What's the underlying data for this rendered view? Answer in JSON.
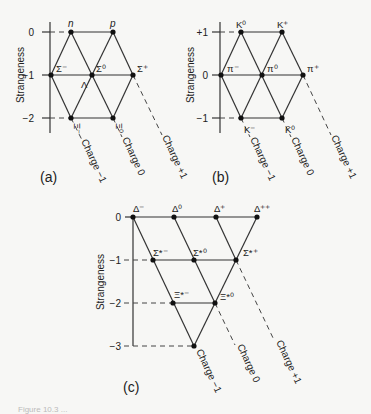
{
  "panels": {
    "a": {
      "label": "(a)",
      "axis_title": "Strangeness",
      "ticks": [
        "0",
        "−1",
        "−2"
      ],
      "particles": {
        "n": "n",
        "p": "p",
        "sigma_minus": "Σ⁻",
        "sigma_zero": "Σ⁰",
        "lambda": "Λ",
        "sigma_plus": "Σ⁺",
        "xi_minus": "Ξ⁻",
        "xi_zero": "Ξ⁰"
      },
      "charge_lines": [
        "Charge −1",
        "Charge 0",
        "Charge +1"
      ]
    },
    "b": {
      "label": "(b)",
      "axis_title": "Strangeness",
      "ticks": [
        "+1",
        "0",
        "−1"
      ],
      "particles": {
        "k_zero": "K⁰",
        "k_plus": "K⁺",
        "pi_minus": "π⁻",
        "pi_zero": "π⁰",
        "pi_plus": "π⁺",
        "k_minus": "K⁻",
        "k_zero_bar": "K̄⁰"
      },
      "charge_lines": [
        "Charge −1",
        "Charge 0",
        "Charge +1"
      ]
    },
    "c": {
      "label": "(c)",
      "axis_title": "Strangeness",
      "ticks": [
        "0",
        "−1",
        "−2",
        "−3"
      ],
      "particles": {
        "delta_minus": "Δ⁻",
        "delta_zero": "Δ⁰",
        "delta_plus": "Δ⁺",
        "delta_plusplus": "Δ⁺⁺",
        "sigma_star_minus": "Σ*⁻",
        "sigma_star_zero": "Σ*⁰",
        "sigma_star_plus": "Σ*⁺",
        "xi_star_minus": "Ξ*⁻",
        "xi_star_zero": "Ξ*⁰"
      },
      "charge_lines": [
        "Charge −1",
        "Charge 0",
        "Charge +1"
      ]
    }
  },
  "caption": "Figure 10.3 ..."
}
